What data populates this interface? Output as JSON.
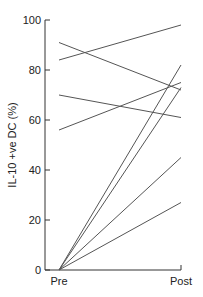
{
  "chart_data": {
    "type": "line",
    "title": "",
    "xlabel": "",
    "ylabel": "IL-10 +ve DC (%)",
    "categories": [
      "Pre",
      "Post"
    ],
    "ylim": [
      0,
      100
    ],
    "yticks": [
      0,
      20,
      40,
      60,
      80,
      100
    ],
    "grid": false,
    "legend": null,
    "series": [
      {
        "name": "subject-1",
        "values": [
          84,
          98
        ]
      },
      {
        "name": "subject-2",
        "values": [
          91,
          72
        ]
      },
      {
        "name": "subject-3",
        "values": [
          70,
          61
        ]
      },
      {
        "name": "subject-4",
        "values": [
          56,
          75
        ]
      },
      {
        "name": "subject-5",
        "values": [
          0,
          82
        ]
      },
      {
        "name": "subject-6",
        "values": [
          0,
          73
        ]
      },
      {
        "name": "subject-7",
        "values": [
          0,
          45
        ]
      },
      {
        "name": "subject-8",
        "values": [
          0,
          27
        ]
      }
    ]
  },
  "labels": {
    "y_axis_title": "IL-10 +ve DC (%)",
    "x_pre": "Pre",
    "x_post": "Post"
  },
  "colors": {
    "axis": "#333333",
    "line": "#555555"
  }
}
